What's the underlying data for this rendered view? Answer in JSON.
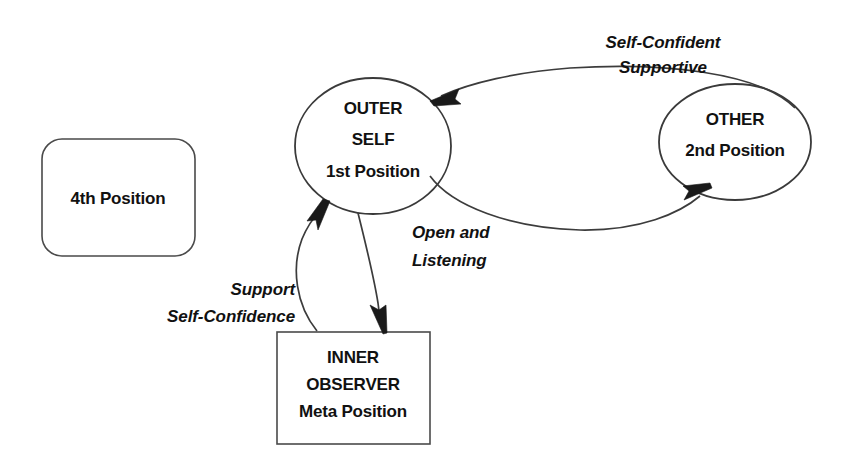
{
  "diagram": {
    "background_color": "#ffffff",
    "stroke_color": "#3a3a3a",
    "text_color": "#111111",
    "nodes": [
      {
        "id": "fourth-position",
        "shape": "rounded-rectangle",
        "lines": [
          "4th  Position"
        ],
        "line1": "4th  Position"
      },
      {
        "id": "outer-self",
        "shape": "ellipse",
        "line1": "OUTER",
        "line2": "SELF",
        "line3": "1st  Position"
      },
      {
        "id": "other",
        "shape": "ellipse",
        "line1": "OTHER",
        "line2": "2nd  Position"
      },
      {
        "id": "inner-observer",
        "shape": "rectangle",
        "line1": "INNER",
        "line2": "OBSERVER",
        "line3": "Meta Position"
      }
    ],
    "edge_labels": {
      "other_to_outer_line1": "Self-Confident",
      "other_to_outer_line2": "Supportive",
      "outer_to_inner_line1": "Open and",
      "outer_to_inner_line2": "Listening",
      "inner_to_outer_line1": "Support",
      "inner_to_outer_line2": "Self-Confidence"
    },
    "edges": [
      {
        "id": "other-to-outer-self",
        "from": "other",
        "to": "outer-self",
        "direction": "left",
        "style": "curved"
      },
      {
        "id": "outer-self-to-other",
        "from": "outer-self",
        "to": "other",
        "direction": "right",
        "style": "curved"
      },
      {
        "id": "inner-observer-to-outer-self",
        "from": "inner-observer",
        "to": "outer-self",
        "direction": "up",
        "style": "curved"
      },
      {
        "id": "outer-self-to-inner-observer",
        "from": "outer-self",
        "to": "inner-observer",
        "direction": "down",
        "style": "curved"
      }
    ]
  }
}
